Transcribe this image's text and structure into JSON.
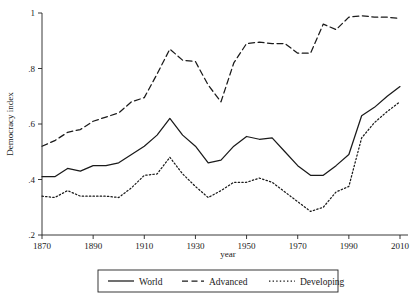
{
  "chart_data": {
    "type": "line",
    "title": "",
    "xlabel": "year",
    "ylabel": "Democracy index",
    "xlim": [
      1870,
      2010
    ],
    "ylim": [
      0.2,
      1.0
    ],
    "xticks": [
      1870,
      1890,
      1910,
      1930,
      1950,
      1970,
      1990,
      2010
    ],
    "xtick_labels": [
      "1870",
      "1890",
      "1910",
      "1930",
      "1950",
      "1970",
      "1990",
      "2010"
    ],
    "yticks": [
      0.2,
      0.4,
      0.6,
      0.8,
      1.0
    ],
    "ytick_labels": [
      ".2",
      ".4",
      ".6",
      ".8",
      "1"
    ],
    "grid": false,
    "legend_position": "bottom-outside",
    "x": [
      1870,
      1875,
      1880,
      1885,
      1890,
      1895,
      1900,
      1905,
      1910,
      1915,
      1920,
      1925,
      1930,
      1935,
      1940,
      1945,
      1950,
      1955,
      1960,
      1965,
      1970,
      1975,
      1980,
      1985,
      1990,
      1995,
      2000,
      2005,
      2010
    ],
    "series": [
      {
        "name": "World",
        "style": "solid",
        "values": [
          0.41,
          0.41,
          0.44,
          0.43,
          0.45,
          0.45,
          0.46,
          0.49,
          0.52,
          0.56,
          0.62,
          0.56,
          0.52,
          0.46,
          0.47,
          0.52,
          0.555,
          0.545,
          0.55,
          0.5,
          0.45,
          0.415,
          0.415,
          0.45,
          0.49,
          0.63,
          0.66,
          0.7,
          0.735
        ]
      },
      {
        "name": "Advanced",
        "style": "dashed",
        "values": [
          0.52,
          0.54,
          0.57,
          0.58,
          0.61,
          0.625,
          0.64,
          0.68,
          0.695,
          0.78,
          0.87,
          0.83,
          0.825,
          0.74,
          0.68,
          0.82,
          0.89,
          0.895,
          0.89,
          0.89,
          0.855,
          0.855,
          0.96,
          0.94,
          0.985,
          0.99,
          0.985,
          0.985,
          0.98
        ]
      },
      {
        "name": "Developing",
        "style": "dotted",
        "values": [
          0.34,
          0.335,
          0.36,
          0.34,
          0.34,
          0.34,
          0.335,
          0.37,
          0.415,
          0.42,
          0.48,
          0.42,
          0.375,
          0.335,
          0.36,
          0.39,
          0.39,
          0.405,
          0.39,
          0.355,
          0.32,
          0.285,
          0.3,
          0.355,
          0.375,
          0.55,
          0.605,
          0.645,
          0.68
        ]
      }
    ]
  },
  "legend": {
    "items": [
      {
        "label": "World",
        "style": "solid"
      },
      {
        "label": "Advanced",
        "style": "dashed"
      },
      {
        "label": "Developing",
        "style": "dotted"
      }
    ]
  }
}
